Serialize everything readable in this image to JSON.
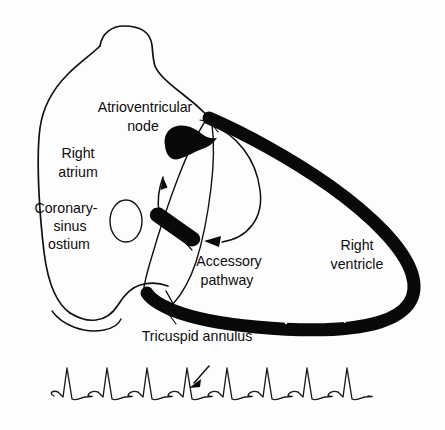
{
  "figure": {
    "background_color": "#fdfdfd",
    "ink_color": "#111111"
  },
  "labels": {
    "av_node": "Atrioventricular\nnode",
    "av_node_line1": "Atrioventricular",
    "av_node_line2": "node",
    "right_atrium_line1": "Right",
    "right_atrium_line2": "atrium",
    "coronary_sinus_line1": "Coronary-",
    "coronary_sinus_line2": "sinus",
    "coronary_sinus_line3": "ostium",
    "accessory_pathway_line1": "Accessory",
    "accessory_pathway_line2": "pathway",
    "right_ventricle_line1": "Right",
    "right_ventricle_line2": "ventricle",
    "tricuspid_annulus": "Tricuspid annulus"
  },
  "structures": [
    {
      "name": "right-atrium",
      "kind": "chamber",
      "label": "Right atrium",
      "fill": "none"
    },
    {
      "name": "right-ventricle",
      "kind": "chamber",
      "label": "Right ventricle",
      "fill": "none"
    },
    {
      "name": "atrioventricular-node",
      "kind": "node",
      "label": "Atrioventricular node",
      "fill": "#090909"
    },
    {
      "name": "accessory-pathway",
      "kind": "bypass-tract",
      "label": "Accessory pathway",
      "fill": "#090909"
    },
    {
      "name": "tricuspid-annulus",
      "kind": "annulus",
      "label": "Tricuspid annulus",
      "fill": "#090909"
    },
    {
      "name": "coronary-sinus-ostium",
      "kind": "ostium",
      "label": "Coronary-sinus ostium",
      "fill": "none"
    }
  ],
  "circuit": {
    "antegrade_arrow": "up-arrow-through-av-node",
    "retrograde_arrow": "loop-arrow-to-accessory-pathway",
    "direction": "reentrant"
  },
  "chart_data": {
    "type": "line",
    "title": "",
    "xlabel": "",
    "ylabel": "",
    "series": [
      {
        "name": "ECG rhythm strip",
        "beats": 8,
        "beat_spacing_px": 40,
        "baseline_y_px": 396,
        "r_peak_y_px": 368,
        "annotation_beat_index": 4,
        "annotation": "arrow marking delta wave / pre-excited complex"
      }
    ],
    "grid": false,
    "legend": "none"
  }
}
